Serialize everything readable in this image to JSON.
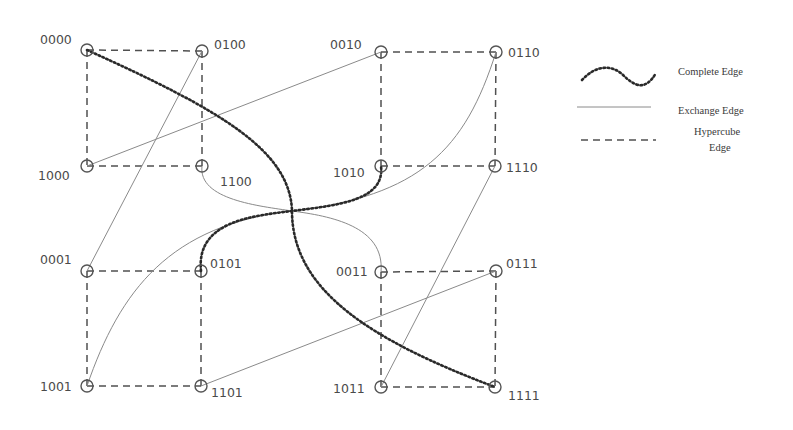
{
  "diagram": {
    "title": "",
    "nodes": [
      {
        "id": "0000",
        "x": 87,
        "y": 50,
        "label": "0000",
        "lx": 40,
        "ly": 44
      },
      {
        "id": "0100",
        "x": 202,
        "y": 51,
        "label": "0100",
        "lx": 214,
        "ly": 49
      },
      {
        "id": "1000",
        "x": 87,
        "y": 166,
        "label": "1000",
        "lx": 38,
        "ly": 180
      },
      {
        "id": "1100",
        "x": 202,
        "y": 166,
        "label": "1100",
        "lx": 220,
        "ly": 186
      },
      {
        "id": "0010",
        "x": 381,
        "y": 52,
        "label": "0010",
        "lx": 330,
        "ly": 49
      },
      {
        "id": "0110",
        "x": 496,
        "y": 52,
        "label": "0110",
        "lx": 508,
        "ly": 57
      },
      {
        "id": "1010",
        "x": 381,
        "y": 166,
        "label": "1010",
        "lx": 333,
        "ly": 177
      },
      {
        "id": "1110",
        "x": 495,
        "y": 166,
        "label": "1110",
        "lx": 506,
        "ly": 172
      },
      {
        "id": "0001",
        "x": 87,
        "y": 271,
        "label": "0001",
        "lx": 40,
        "ly": 264
      },
      {
        "id": "0101",
        "x": 201,
        "y": 271,
        "label": "0101",
        "lx": 210,
        "ly": 268
      },
      {
        "id": "1001",
        "x": 87,
        "y": 386,
        "label": "1001",
        "lx": 40,
        "ly": 391
      },
      {
        "id": "1101",
        "x": 201,
        "y": 386,
        "label": "1101",
        "lx": 211,
        "ly": 397
      },
      {
        "id": "0011",
        "x": 381,
        "y": 272,
        "label": "0011",
        "lx": 336,
        "ly": 276
      },
      {
        "id": "0111",
        "x": 496,
        "y": 271,
        "label": "0111",
        "lx": 506,
        "ly": 268
      },
      {
        "id": "1011",
        "x": 381,
        "y": 387,
        "label": "1011",
        "lx": 333,
        "ly": 393
      },
      {
        "id": "1111",
        "x": 495,
        "y": 387,
        "label": "1111",
        "lx": 508,
        "ly": 400
      }
    ],
    "hypercube_edges": [
      [
        "0000",
        "0100"
      ],
      [
        "0000",
        "1000"
      ],
      [
        "0100",
        "1100"
      ],
      [
        "1000",
        "1100"
      ],
      [
        "0010",
        "0110"
      ],
      [
        "0010",
        "1010"
      ],
      [
        "0110",
        "1110"
      ],
      [
        "1010",
        "1110"
      ],
      [
        "0001",
        "0101"
      ],
      [
        "0001",
        "1001"
      ],
      [
        "0101",
        "1101"
      ],
      [
        "1001",
        "1101"
      ],
      [
        "0011",
        "0111"
      ],
      [
        "0011",
        "1011"
      ],
      [
        "0111",
        "1111"
      ],
      [
        "1011",
        "1111"
      ]
    ],
    "exchange_edges": [
      {
        "from": "1000",
        "to": "0010",
        "shape": "line"
      },
      {
        "from": "0100",
        "to": "0001",
        "shape": "line"
      },
      {
        "from": "1101",
        "to": "0111",
        "shape": "line"
      },
      {
        "from": "1110",
        "to": "1011",
        "shape": "line"
      },
      {
        "from": "1100",
        "to": "0011",
        "shape": "curve",
        "path": "M202,166 C198,200 260,206 292,211 C330,216 385,226 381,272"
      },
      {
        "from": "1001",
        "to": "0110",
        "shape": "curve",
        "path": "M87,386 C120,290 170,225 292,211 C420,196 465,150 496,52"
      }
    ],
    "complete_edges": [
      {
        "from": "0000",
        "to": "1111",
        "path": "M87,50 C220,110 290,150 292,211 C292,290 370,340 495,387"
      },
      {
        "from": "0101",
        "to": "1010",
        "path": "M201,271 C196,222 250,216 292,211 C340,205 385,200 381,166"
      }
    ],
    "legend": {
      "items": [
        {
          "type": "complete",
          "label": "Complete Edge"
        },
        {
          "type": "exchange",
          "label": "Exchange Edge"
        },
        {
          "type": "hypercube",
          "label_line1": "Hypercube",
          "label_line2": "Edge"
        }
      ]
    },
    "colors": {
      "node_stroke": "#555555",
      "hypercube_edge": "#505050",
      "exchange_edge": "#8a8a8a",
      "complete_edge": "#2a2a2a",
      "label": "#4a4a4a"
    }
  }
}
